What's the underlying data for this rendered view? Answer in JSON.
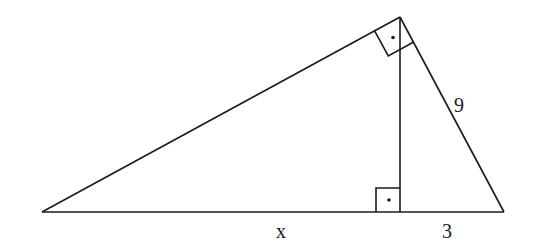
{
  "diagram": {
    "type": "right-triangle-with-altitude",
    "vertices": {
      "left": [
        42,
        212
      ],
      "top": [
        400,
        17
      ],
      "right": [
        504,
        212
      ],
      "foot": [
        400,
        212
      ]
    },
    "labels": {
      "base_left_segment": "x",
      "base_right_segment": "3",
      "hypotenuse_right_side": "9"
    },
    "right_angle_marks": [
      "top-vertex",
      "altitude-foot"
    ],
    "stroke_color": "#1a1a1a",
    "background": "#ffffff"
  }
}
